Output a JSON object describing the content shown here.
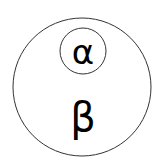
{
  "diagram": {
    "outer_circle": {
      "label": "β",
      "cx": 82,
      "cy": 87,
      "r": 69,
      "stroke": "#333333"
    },
    "inner_circle": {
      "label": "α",
      "cx": 83,
      "cy": 51,
      "r": 23,
      "stroke": "#333333"
    },
    "relation": "α is contained in β"
  }
}
